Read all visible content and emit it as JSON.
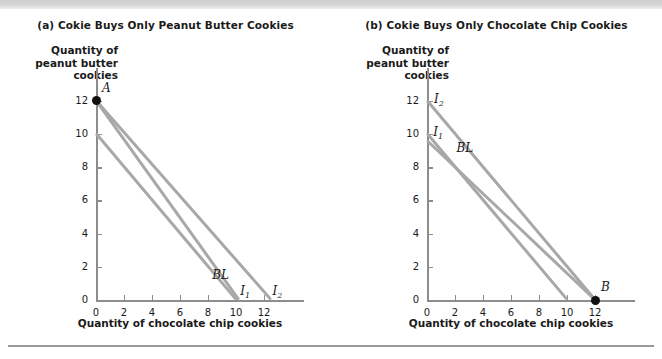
{
  "figure": {
    "background_color": "#ffffff",
    "line_color": "#a8a8a8",
    "axis_color": "#8d8d8d",
    "point_color": "#111111"
  },
  "panels": [
    {
      "id": "a",
      "title": "(a) Cokie Buys Only Peanut Butter Cookies",
      "ylabel_lines": [
        "Quantity of",
        "peanut butter",
        "cookies"
      ],
      "xlabel": "Quantity of chocolate chip cookies",
      "y_ticks": [
        "0",
        "2",
        "4",
        "6",
        "8",
        "10",
        "12"
      ],
      "x_ticks": [
        "0",
        "2",
        "4",
        "6",
        "8",
        "10",
        "12"
      ],
      "points": [
        {
          "label": "A",
          "x": 0,
          "y": 12
        }
      ],
      "curves": [
        {
          "label": "BL",
          "label_text": "BL",
          "x0": 0,
          "y0": 10,
          "x1": 10.0,
          "y1": 0
        },
        {
          "label": "I1",
          "label_text": "I",
          "sub": "1",
          "x0": 0,
          "y0": 12,
          "x1": 10.2,
          "y1": 0
        },
        {
          "label": "I2",
          "label_text": "I",
          "sub": "2",
          "x0": 0,
          "y0": 12,
          "x1": 12.5,
          "y1": 0
        }
      ]
    },
    {
      "id": "b",
      "title": "(b) Cokie Buys Only Chocolate Chip Cookies",
      "ylabel_lines": [
        "Quantity of",
        "peanut butter",
        "cookies"
      ],
      "xlabel": "Quantity of chocolate chip cookies",
      "y_ticks": [
        "0",
        "2",
        "4",
        "6",
        "8",
        "10",
        "12"
      ],
      "x_ticks": [
        "0",
        "2",
        "4",
        "6",
        "8",
        "10",
        "12"
      ],
      "points": [
        {
          "label": "B",
          "x": 12,
          "y": 0
        }
      ],
      "curves": [
        {
          "label": "I2",
          "label_text": "I",
          "sub": "2",
          "x0": 0,
          "y0": 12,
          "x1": 12.0,
          "y1": 0
        },
        {
          "label": "I1",
          "label_text": "I",
          "sub": "1",
          "x0": 0,
          "y0": 10,
          "x1": 10.0,
          "y1": 0
        },
        {
          "label": "BL",
          "label_text": "BL",
          "x0": 0,
          "y0": 9.6,
          "x1": 12.0,
          "y1": 0
        }
      ]
    }
  ],
  "chart_data": {
    "type": "line",
    "xlabel": "Quantity of chocolate chip cookies",
    "ylabel": "Quantity of peanut butter cookies",
    "xlim": [
      0,
      13.5
    ],
    "ylim": [
      0,
      13.5
    ],
    "xticks": [
      0,
      2,
      4,
      6,
      8,
      10,
      12
    ],
    "yticks": [
      0,
      2,
      4,
      6,
      8,
      10,
      12
    ],
    "grid": false,
    "legend": "none",
    "panels": [
      {
        "panel": "a",
        "title": "(a) Cokie Buys Only Peanut Butter Cookies",
        "series": [
          {
            "name": "BL",
            "x": [
              0,
              10.0
            ],
            "y": [
              10,
              0
            ]
          },
          {
            "name": "I1",
            "x": [
              0,
              10.2
            ],
            "y": [
              12,
              0
            ]
          },
          {
            "name": "I2",
            "x": [
              0,
              12.5
            ],
            "y": [
              12,
              0
            ]
          }
        ],
        "annotations": [
          {
            "text": "A",
            "x": 0,
            "y": 12,
            "marker": "filled-circle"
          }
        ]
      },
      {
        "panel": "b",
        "title": "(b) Cokie Buys Only Chocolate Chip Cookies",
        "series": [
          {
            "name": "I2",
            "x": [
              0,
              12.0
            ],
            "y": [
              12,
              0
            ]
          },
          {
            "name": "I1",
            "x": [
              0,
              10.0
            ],
            "y": [
              10,
              0
            ]
          },
          {
            "name": "BL",
            "x": [
              0,
              12.0
            ],
            "y": [
              9.6,
              0
            ]
          }
        ],
        "annotations": [
          {
            "text": "B",
            "x": 12,
            "y": 0,
            "marker": "filled-circle"
          }
        ]
      }
    ]
  }
}
